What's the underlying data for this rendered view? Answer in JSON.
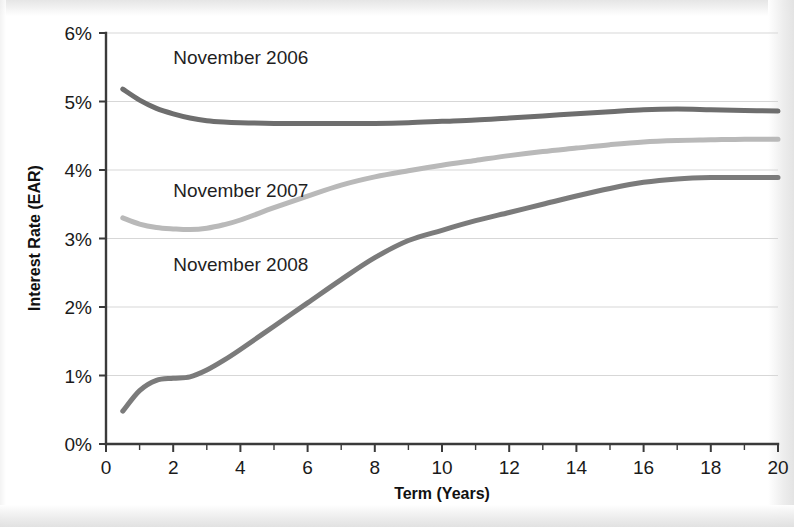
{
  "chart_data": {
    "type": "line",
    "title": "",
    "xlabel": "Term (Years)",
    "ylabel": "Interest Rate (EAR)",
    "xlim": [
      0,
      20
    ],
    "ylim": [
      0,
      6
    ],
    "grid": true,
    "legend_position": "inline-annotations",
    "x_tick_labels": [
      "0",
      "2",
      "4",
      "6",
      "8",
      "10",
      "12",
      "14",
      "16",
      "18",
      "20"
    ],
    "x_tick_values": [
      0,
      2,
      4,
      6,
      8,
      10,
      12,
      14,
      16,
      18,
      20
    ],
    "x_minor_tick_values": [
      1,
      3,
      5,
      7,
      9,
      11,
      13,
      15,
      17,
      19
    ],
    "y_tick_labels": [
      "0%",
      "1%",
      "2%",
      "3%",
      "4%",
      "5%",
      "6%"
    ],
    "y_tick_values": [
      0,
      1,
      2,
      3,
      4,
      5,
      6
    ],
    "x": [
      0.5,
      1,
      1.5,
      2,
      2.5,
      3,
      3.5,
      4,
      5,
      6,
      7,
      8,
      9,
      10,
      11,
      12,
      13,
      14,
      15,
      16,
      17,
      18,
      19,
      20
    ],
    "series": [
      {
        "name": "November 2006",
        "color": "#6e6e6e",
        "values": [
          5.18,
          5.02,
          4.9,
          4.82,
          4.76,
          4.72,
          4.7,
          4.69,
          4.68,
          4.68,
          4.68,
          4.68,
          4.69,
          4.71,
          4.73,
          4.76,
          4.79,
          4.82,
          4.85,
          4.88,
          4.89,
          4.88,
          4.87,
          4.86
        ],
        "label_x": 2.0,
        "label_y": 5.55
      },
      {
        "name": "November 2007",
        "color": "#b9b9b9",
        "values": [
          3.3,
          3.21,
          3.16,
          3.14,
          3.13,
          3.15,
          3.2,
          3.27,
          3.45,
          3.62,
          3.78,
          3.9,
          3.99,
          4.07,
          4.14,
          4.21,
          4.27,
          4.32,
          4.37,
          4.41,
          4.43,
          4.44,
          4.45,
          4.45
        ],
        "label_x": 2.0,
        "label_y": 3.6
      },
      {
        "name": "November 2008",
        "color": "#7b7b7b",
        "values": [
          0.48,
          0.78,
          0.93,
          0.96,
          0.98,
          1.08,
          1.22,
          1.38,
          1.72,
          2.06,
          2.4,
          2.72,
          2.97,
          3.12,
          3.26,
          3.38,
          3.5,
          3.62,
          3.73,
          3.82,
          3.87,
          3.89,
          3.89,
          3.89
        ],
        "label_x": 2.0,
        "label_y": 2.52
      }
    ]
  },
  "axis": {
    "x_title": "Term (Years)",
    "y_title": "Interest Rate (EAR)"
  },
  "style": {
    "axis_color": "#3a3a3a",
    "grid_color": "#d7d7d7",
    "text_color": "#1a1a1a",
    "background": "#ffffff"
  }
}
